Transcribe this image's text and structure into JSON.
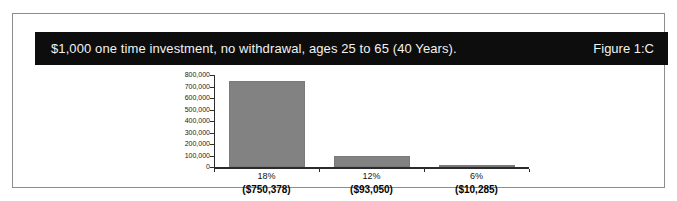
{
  "figure": {
    "header": {
      "title": "$1,000 one time investment, no withdrawal, ages 25 to 65 (40 Years).",
      "figure_label": "Figure 1:C",
      "background_color": "#0d0d0d",
      "text_color": "#f2f2f2"
    },
    "frame_border_color": "#8d8d8d"
  },
  "chart_data": {
    "type": "bar",
    "title": "$1,000 one time investment, no withdrawal, ages 25 to 65 (40 Years).",
    "categories": [
      "18%",
      "12%",
      "6%"
    ],
    "category_amounts": [
      "($750,378)",
      "($93,050)",
      "($10,285)"
    ],
    "values": [
      750378,
      93050,
      10285
    ],
    "series": [
      {
        "name": "Ending balance",
        "values": [
          750378,
          93050,
          10285
        ]
      }
    ],
    "xlabel": "",
    "ylabel": "",
    "ylim": [
      0,
      800000
    ],
    "ytick_labels": [
      "800,000",
      "700,000",
      "600,000",
      "500,000",
      "400,000",
      "300,000",
      "200,000",
      "100,000",
      "0"
    ],
    "ytick_values": [
      800000,
      700000,
      600000,
      500000,
      400000,
      300000,
      200000,
      100000,
      0
    ],
    "grid": false,
    "legend": false,
    "bar_color": "#828282",
    "axis_color": "#2b2b2b"
  }
}
